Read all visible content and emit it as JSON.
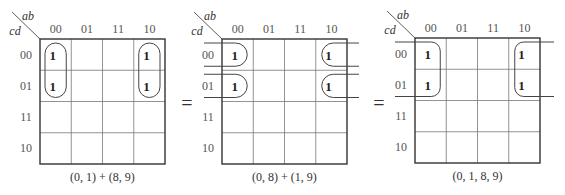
{
  "kmaps": [
    {
      "row_var": "cd",
      "col_var": "ab",
      "col_labels": [
        "00",
        "01",
        "11",
        "10"
      ],
      "row_labels": [
        "00",
        "01",
        "11",
        "10"
      ],
      "ones": [
        [
          0,
          0
        ],
        [
          1,
          0
        ],
        [
          0,
          3
        ],
        [
          1,
          3
        ]
      ],
      "grouping": "vertical-pairs",
      "caption": "(0, 1) + (8, 9)"
    },
    {
      "row_var": "cd",
      "col_var": "ab",
      "col_labels": [
        "00",
        "01",
        "11",
        "10"
      ],
      "row_labels": [
        "00",
        "01",
        "11",
        "10"
      ],
      "ones": [
        [
          0,
          0
        ],
        [
          1,
          0
        ],
        [
          0,
          3
        ],
        [
          1,
          3
        ]
      ],
      "grouping": "horizontal-wraparound-pairs",
      "caption": "(0, 8) + (1, 9)"
    },
    {
      "row_var": "cd",
      "col_var": "ab",
      "col_labels": [
        "00",
        "01",
        "11",
        "10"
      ],
      "row_labels": [
        "00",
        "01",
        "11",
        "10"
      ],
      "ones": [
        [
          0,
          0
        ],
        [
          1,
          0
        ],
        [
          0,
          3
        ],
        [
          1,
          3
        ]
      ],
      "grouping": "quad-wraparound",
      "caption": "(0, 1, 8, 9)"
    }
  ],
  "separators": [
    "=",
    "="
  ],
  "colors": {
    "grid": "#333333",
    "inner_grid": "#777777",
    "loop": "#444444"
  }
}
